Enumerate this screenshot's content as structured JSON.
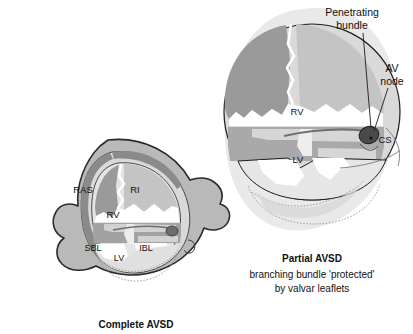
{
  "figure": {
    "title_visible": false,
    "background_color": "#ffffff"
  },
  "palette": {
    "halo": "#e9e9e9",
    "muscle_wall": "#b9b9b9",
    "wall_outline": "#2a2a2a",
    "endocardium_ring": "#8e8e8e",
    "chamber_light": "#d8d8d8",
    "chamber_pale": "#eaeaea",
    "septum_dark": "#989898",
    "leaflet_mid": "#a9a9a9",
    "leaflet_light": "#c8c8c8",
    "node_dark": "#4a4a4a",
    "white": "#ffffff",
    "text": "#111111"
  },
  "panels": [
    {
      "id": "complete-avsd",
      "caption_title": "Complete AVSD",
      "caption_lines": [],
      "chamber_labels": [
        {
          "key": "ras",
          "text": "RAS",
          "x": 82,
          "y": 190
        },
        {
          "key": "ri",
          "text": "RI",
          "x": 133,
          "y": 190
        },
        {
          "key": "rv",
          "text": "RV",
          "x": 112,
          "y": 215
        },
        {
          "key": "sbl",
          "text": "SBL",
          "x": 92,
          "y": 245
        },
        {
          "key": "ibl",
          "text": "IBL",
          "x": 144,
          "y": 245
        },
        {
          "key": "lv",
          "text": "LV",
          "x": 119,
          "y": 255
        }
      ]
    },
    {
      "id": "partial-avsd",
      "caption_title": "Partial AVSD",
      "caption_lines": [
        "branching bundle 'protected'",
        "by valvar leaflets"
      ],
      "chamber_labels": [
        {
          "key": "rv",
          "text": "RV",
          "x": 297,
          "y": 115
        },
        {
          "key": "lv",
          "text": "LV",
          "x": 298,
          "y": 163
        }
      ],
      "annotations": [
        {
          "key": "penetrating-bundle",
          "lines": [
            "Penetrating",
            "bundle"
          ],
          "x": 352,
          "y": 13
        },
        {
          "key": "av-node",
          "lines": [
            "AV",
            "node"
          ],
          "x": 392,
          "y": 72
        },
        {
          "key": "coronary-sinus",
          "lines": [
            "CS"
          ],
          "x": 383,
          "y": 139
        }
      ]
    }
  ]
}
